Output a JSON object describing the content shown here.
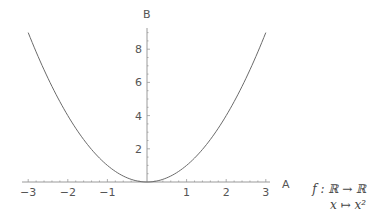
{
  "chart_data": {
    "type": "line",
    "title": "",
    "xlabel": "A",
    "ylabel": "B",
    "xlim": [
      -3,
      3
    ],
    "ylim": [
      0,
      9
    ],
    "grid": false,
    "legend": null,
    "x_ticks": [
      "-3",
      "-2",
      "-1",
      "1",
      "2",
      "3"
    ],
    "x_tick_values": [
      -3,
      -2,
      -1,
      1,
      2,
      3
    ],
    "y_ticks": [
      "2",
      "4",
      "6",
      "8"
    ],
    "y_tick_values": [
      2,
      4,
      6,
      8
    ],
    "series": [
      {
        "name": "f(x) = x^2",
        "x": [
          -3,
          -2.5,
          -2,
          -1.5,
          -1,
          -0.5,
          0,
          0.5,
          1,
          1.5,
          2,
          2.5,
          3
        ],
        "values": [
          9,
          6.25,
          4,
          2.25,
          1,
          0.25,
          0,
          0.25,
          1,
          2.25,
          4,
          6.25,
          9
        ]
      }
    ],
    "annotations": [
      {
        "line1": "f : ℝ → ℝ",
        "line2": "x ↦ x²"
      }
    ]
  },
  "labels": {
    "x_axis": "A",
    "y_axis": "B",
    "annotation_line1": "f : ℝ → ℝ",
    "annotation_line2": "x ↦ x²"
  },
  "colors": {
    "curve": "#6b6b6b",
    "axis": "#9a9a9a",
    "text": "#555555"
  }
}
